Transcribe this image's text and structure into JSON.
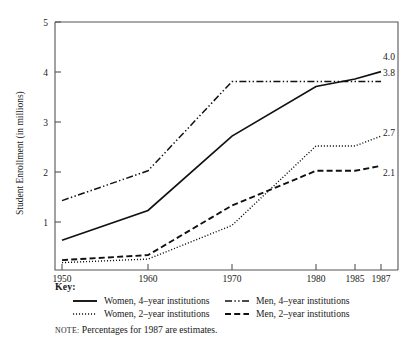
{
  "chart_data": {
    "type": "line",
    "title": "",
    "xlabel": "",
    "ylabel": "Student Enrollment (in millions)",
    "x": [
      1950,
      1960,
      1970,
      1980,
      1985,
      1987
    ],
    "xticklabels": [
      "1950",
      "1960",
      "1970",
      "1980",
      "1985",
      "1987"
    ],
    "yticklabels": [
      "1",
      "2",
      "3",
      "4",
      "5"
    ],
    "yticks": [
      1,
      2,
      3,
      4,
      5
    ],
    "ylim": [
      0,
      5
    ],
    "grid": false,
    "legend_position": "bottom",
    "note": "Percentages for 1987 are estimates.",
    "series": [
      {
        "name": "Women, 4-year institutions",
        "style": "solid",
        "end_label": "4.0",
        "values": [
          0.6,
          1.2,
          2.7,
          3.7,
          3.85,
          4.0
        ]
      },
      {
        "name": "Men, 4-year institutions",
        "style": "dash-dot-dot",
        "end_label": "3.8",
        "values": [
          1.4,
          2.0,
          3.8,
          3.8,
          3.8,
          3.8
        ]
      },
      {
        "name": "Women, 2-year institutions",
        "style": "dotted",
        "end_label": "2.7",
        "values": [
          0.15,
          0.22,
          0.9,
          2.5,
          2.5,
          2.7
        ]
      },
      {
        "name": "Men, 2-year institutions",
        "style": "dashed",
        "end_label": "2.1",
        "values": [
          0.2,
          0.3,
          1.3,
          2.0,
          2.0,
          2.1
        ]
      }
    ]
  },
  "axis": {
    "y_title": "Student Enrollment (in millions)",
    "y_ticks": [
      "1",
      "2",
      "3",
      "4",
      "5"
    ],
    "x_ticks": [
      "1950",
      "1960",
      "1970",
      "1980",
      "1985",
      "1987"
    ]
  },
  "end_labels": {
    "women4": "4.0",
    "men4": "3.8",
    "women2": "2.7",
    "men2": "2.1"
  },
  "key": {
    "title": "Key:",
    "items": [
      {
        "label": "Women, 4–year institutions",
        "style": "solid"
      },
      {
        "label": "Men, 4–year institutions",
        "style": "dash-dot-dot"
      },
      {
        "label": "Women, 2–year institutions",
        "style": "dotted"
      },
      {
        "label": "Men, 2–year institutions",
        "style": "dashed"
      }
    ]
  },
  "note": {
    "lead": "NOTE:",
    "text": "Percentages for 1987 are estimates."
  }
}
